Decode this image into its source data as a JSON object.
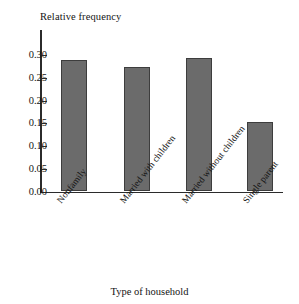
{
  "chart_data": {
    "type": "bar",
    "title": "",
    "xlabel": "Type of household",
    "ylabel": "Relative frequency",
    "categories": [
      "Nonfamily",
      "Married with children",
      "Married without children",
      "Single parent"
    ],
    "values": [
      0.29,
      0.273,
      0.293,
      0.152
    ],
    "ylim": [
      0.0,
      0.3
    ],
    "ytick_labels": [
      "0.00",
      "0.05",
      "0.10",
      "0.15",
      "0.20",
      "0.25",
      "0.30"
    ],
    "ytick_values": [
      0.0,
      0.05,
      0.1,
      0.15,
      0.2,
      0.25,
      0.3
    ],
    "grid": false,
    "legend": false,
    "bar_color": "#6b6b6b",
    "bar_edge_color": "#3d3d3d",
    "axis_color": "#2b2b2b",
    "background": "#ffffff"
  }
}
